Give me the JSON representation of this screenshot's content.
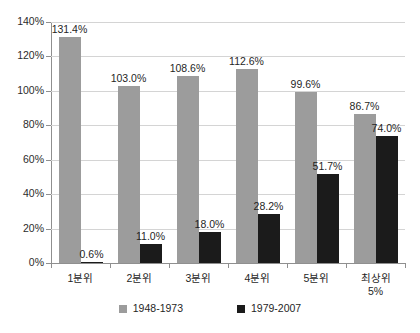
{
  "chart_data": {
    "type": "bar",
    "title": "",
    "subtitle": "",
    "xlabel": "",
    "ylabel": "",
    "categories": [
      "1분위",
      "2분위",
      "3분위",
      "4분위",
      "5분위",
      "최상위\n5%"
    ],
    "series": [
      {
        "name": "1948-1973",
        "color": "#9c9c9c",
        "values": [
          131.4,
          103.0,
          108.6,
          112.6,
          99.6,
          86.7
        ],
        "labels": [
          "131.4%",
          "103.0%",
          "108.6%",
          "112.6%",
          "99.6%",
          "86.7%"
        ]
      },
      {
        "name": "1979-2007",
        "color": "#1b1b1b",
        "values": [
          0.6,
          11.0,
          18.0,
          28.2,
          51.7,
          74.0
        ],
        "labels": [
          "0.6%",
          "11.0%",
          "18.0%",
          "28.2%",
          "51.7%",
          "74.0%"
        ]
      }
    ],
    "ylim": [
      0,
      140
    ],
    "ytick_values": [
      0,
      20,
      40,
      60,
      80,
      100,
      120,
      140
    ],
    "ytick_labels": [
      "0%",
      "20%",
      "40%",
      "60%",
      "80%",
      "100%",
      "120%",
      "140%"
    ],
    "grid": true,
    "legend_position": "bottom"
  },
  "legend": {
    "items": [
      {
        "label": "1948-1973"
      },
      {
        "label": "1979-2007"
      }
    ]
  }
}
